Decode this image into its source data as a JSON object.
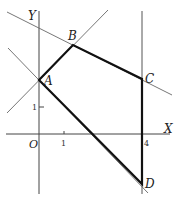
{
  "diagram": {
    "type": "coordinate-geometry",
    "axes": {
      "x_label": "X",
      "y_label": "Y",
      "origin_label": "O",
      "x_ticks": [
        {
          "value": 1,
          "label": "1"
        },
        {
          "value": 4,
          "label": "4"
        }
      ],
      "y_ticks": [
        {
          "value": 1,
          "label": "1"
        }
      ]
    },
    "points": [
      {
        "name": "A",
        "label": "A",
        "x": 0,
        "y": 2
      },
      {
        "name": "B",
        "label": "B",
        "x": 1.3,
        "y": 3.3
      },
      {
        "name": "C",
        "label": "C",
        "x": 4,
        "y": 2
      },
      {
        "name": "D",
        "label": "D",
        "x": 4,
        "y": -1.9
      }
    ],
    "polygon": [
      "A",
      "B",
      "C",
      "D"
    ],
    "boundary_lines": [
      "line through A and B",
      "line through B and C",
      "line x = 4",
      "line through A and D"
    ],
    "colors": {
      "axis": "#444444",
      "thin_line": "#666666",
      "polygon": "#111111",
      "background": "#ffffff"
    }
  }
}
